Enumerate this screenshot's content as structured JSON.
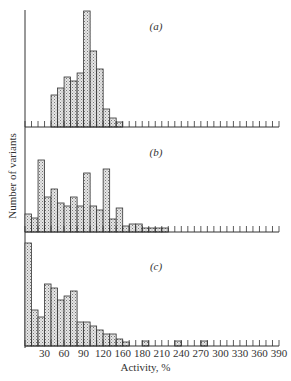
{
  "chart_data": {
    "type": "bar",
    "title": "",
    "xlabel": "Activity, %",
    "ylabel": "Number of variants",
    "x_tick_labels": [
      "30",
      "60",
      "90",
      "120",
      "160",
      "180",
      "210",
      "240",
      "270",
      "300",
      "330",
      "360",
      "390"
    ],
    "x_tick_values": [
      30,
      60,
      90,
      120,
      150,
      180,
      210,
      240,
      270,
      300,
      330,
      360,
      390
    ],
    "xlim": [
      0,
      390
    ],
    "bin_width": 10,
    "grid": false,
    "legend": null,
    "panels": [
      {
        "label": "(a)",
        "bins_start": [
          40,
          50,
          60,
          70,
          80,
          90,
          100,
          110,
          120,
          130,
          140
        ],
        "values": [
          32,
          39,
          50,
          46,
          54,
          116,
          76,
          58,
          18,
          9,
          5
        ]
      },
      {
        "label": "(b)",
        "bins_start": [
          0,
          10,
          20,
          30,
          40,
          50,
          60,
          70,
          80,
          90,
          100,
          110,
          120,
          130,
          140,
          150,
          160,
          170,
          180,
          190,
          200,
          210
        ],
        "values": [
          18,
          14,
          72,
          35,
          43,
          29,
          26,
          35,
          26,
          59,
          26,
          22,
          63,
          13,
          24,
          6,
          8,
          8,
          4,
          4,
          4,
          4
        ]
      },
      {
        "label": "(c)",
        "bins_start": [
          0,
          10,
          20,
          30,
          40,
          50,
          60,
          70,
          80,
          90,
          100,
          110,
          120,
          130,
          140,
          150,
          180,
          230,
          270
        ],
        "values": [
          103,
          36,
          29,
          62,
          58,
          46,
          50,
          55,
          24,
          24,
          20,
          16,
          12,
          12,
          7,
          4,
          5,
          5,
          5
        ]
      }
    ],
    "units_note": "values are relative bar heights (px-scale); no y-axis ticks shown"
  },
  "labels": {
    "ylabel": "Number of variants",
    "xlabel": "Activity, %"
  },
  "colors": {
    "bar_fill": "#d0d0d0",
    "bar_stroke": "#333333",
    "axis": "#333333"
  }
}
